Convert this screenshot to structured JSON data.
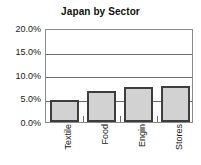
{
  "chart_data": {
    "type": "bar",
    "title": "Japan by Sector",
    "xlabel": "",
    "ylabel": "",
    "categories": [
      "Textile",
      "Food",
      "Engin",
      "Stores"
    ],
    "values": [
      4.7,
      6.7,
      7.5,
      7.6
    ],
    "value_unit": "percent",
    "ylim": [
      0,
      20
    ],
    "ytick_values": [
      0,
      5,
      10,
      15,
      20
    ],
    "ytick_labels": [
      "0.0%",
      "5.0%",
      "10.0%",
      "15.0%",
      "20.0%"
    ],
    "grid": true,
    "grid_orientation": "horizontal",
    "legend": false,
    "legend_position": "none",
    "series": [
      {
        "name": "Japan by Sector",
        "values": [
          4.7,
          6.7,
          7.5,
          7.6
        ]
      }
    ]
  },
  "style": {
    "bar_fill": "#d2d2d2",
    "bar_border": "#3d3d3d",
    "gridline_color": "#6e6e6e",
    "axis_color": "#8a8a8a",
    "background": "#ffffff",
    "text_color": "#1a1a1a"
  }
}
